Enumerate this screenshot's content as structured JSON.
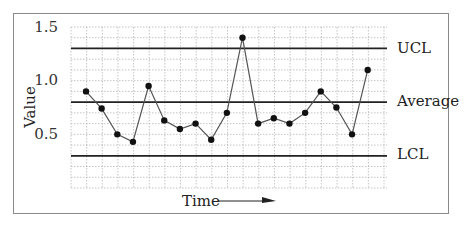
{
  "chart_data": {
    "type": "line",
    "title": "",
    "subtitle": "",
    "xlabel": "Time",
    "ylabel": "Value",
    "ylim": [
      0.0,
      1.5
    ],
    "yticks": [
      0.5,
      1.0,
      1.5
    ],
    "ytick_labels": [
      "0.5",
      "1.0",
      "1.5"
    ],
    "grid": true,
    "legend": null,
    "x": [
      1,
      2,
      3,
      4,
      5,
      6,
      7,
      8,
      9,
      10,
      11,
      12,
      13,
      14,
      15,
      16,
      17,
      18,
      19
    ],
    "series": [
      {
        "name": "Value",
        "values": [
          0.9,
          0.74,
          0.5,
          0.43,
          0.95,
          0.63,
          0.55,
          0.6,
          0.45,
          0.7,
          1.4,
          0.6,
          0.65,
          0.6,
          0.7,
          0.9,
          0.75,
          0.5,
          1.1
        ]
      }
    ],
    "reference_lines": [
      {
        "name": "UCL",
        "label": "UCL",
        "value": 1.3
      },
      {
        "name": "Average",
        "label": "Average",
        "value": 0.8
      },
      {
        "name": "LCL",
        "label": "LCL",
        "value": 0.3
      }
    ],
    "annotations": [
      "Time →"
    ]
  },
  "labels": {
    "ylabel": "Value",
    "xlabel": "Time",
    "ucl": "UCL",
    "average": "Average",
    "lcl": "LCL",
    "ytick_15": "1.5",
    "ytick_10": "1.0",
    "ytick_05": "0.5"
  },
  "colors": {
    "line": "#555555",
    "marker": "#111111",
    "control_line": "#222222",
    "grid": "#b5b5b5"
  }
}
